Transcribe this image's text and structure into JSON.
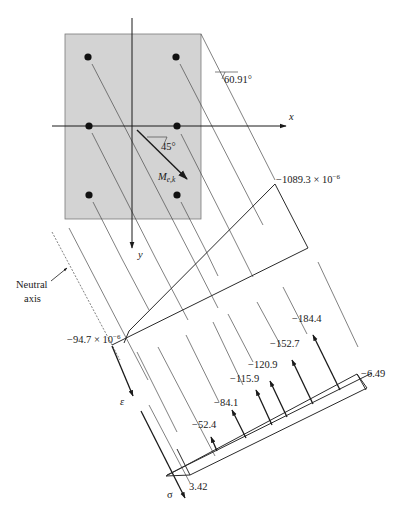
{
  "figure": {
    "section": {
      "fill_color": "#d3d3d3",
      "bar_color": "#111111",
      "axis_x_label": "x",
      "axis_y_label": "y",
      "moment_label": "M",
      "moment_subscript": "e,k",
      "moment_angle": "45°",
      "neutral_axis_angle": "60.91°",
      "bars": [
        {
          "row": "top",
          "col": "left"
        },
        {
          "row": "top",
          "col": "right"
        },
        {
          "row": "middle",
          "col": "left"
        },
        {
          "row": "middle",
          "col": "right"
        },
        {
          "row": "bottom",
          "col": "left"
        },
        {
          "row": "bottom",
          "col": "right"
        }
      ]
    },
    "neutral_axis": {
      "label_line1": "Neutral",
      "label_line2": "axis"
    },
    "strain_diagram": {
      "symbol": "ε",
      "max_strain_label": "−1089.3 × 10",
      "max_strain_exp": "−6",
      "min_strain_label": "−94.7 × 10",
      "min_strain_exp": "−6"
    },
    "stress_diagram": {
      "symbol": "σ",
      "bottom_value": "3.42",
      "top_value": "−6.49",
      "bar_forces": [
        "−52.4",
        "−84.1",
        "−115.9",
        "−120.9",
        "−152.7",
        "−184.4"
      ]
    }
  }
}
